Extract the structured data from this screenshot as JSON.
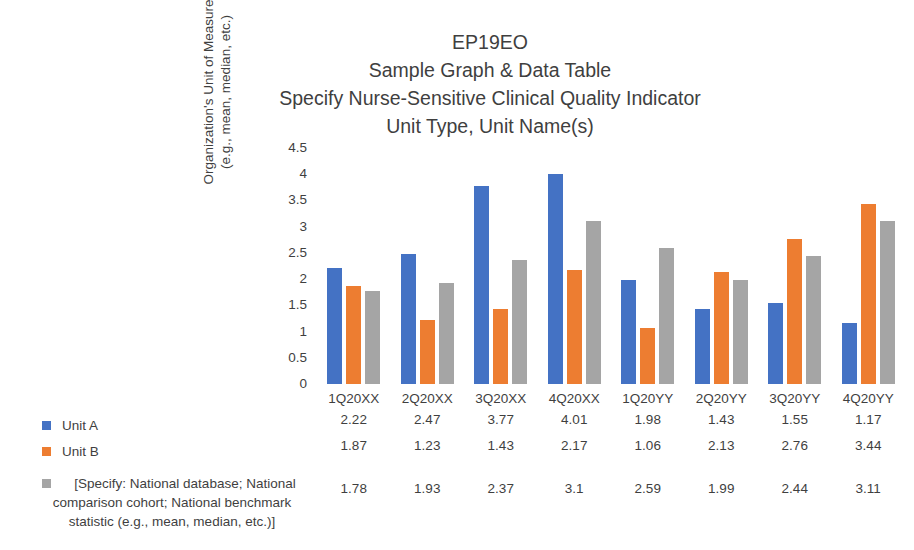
{
  "chart_data": {
    "type": "bar",
    "title": "EP19EO\nSample Graph & Data Table\nSpecify Nurse-Sensitive Clinical Quality Indicator\nUnit Type, Unit Name(s)",
    "title_lines": [
      "EP19EO",
      "Sample Graph & Data Table",
      "Specify Nurse-Sensitive Clinical Quality Indicator",
      "Unit Type, Unit Name(s)"
    ],
    "xlabel": "",
    "ylabel": "Organization's Unit of Measure (e.g., mean, median, etc.)",
    "ylabel_lines": [
      "Organization's Unit of Measure",
      "(e.g., mean, median, etc.)"
    ],
    "categories": [
      "1Q20XX",
      "2Q20XX",
      "3Q20XX",
      "4Q20XX",
      "1Q20YY",
      "2Q20YY",
      "3Q20YY",
      "4Q20YY"
    ],
    "series": [
      {
        "name": "Unit A",
        "color": "#4472C4",
        "values": [
          2.22,
          2.47,
          3.77,
          4.01,
          1.98,
          1.43,
          1.55,
          1.17
        ],
        "labels": [
          "2.22",
          "2.47",
          "3.77",
          "4.01",
          "1.98",
          "1.43",
          "1.55",
          "1.17"
        ]
      },
      {
        "name": "Unit B",
        "color": "#ED7D31",
        "values": [
          1.87,
          1.23,
          1.43,
          2.17,
          1.06,
          2.13,
          2.76,
          3.44
        ],
        "labels": [
          "1.87",
          "1.23",
          "1.43",
          "2.17",
          "1.06",
          "2.13",
          "2.76",
          "3.44"
        ]
      },
      {
        "name": "[Specify: National database; National comparison cohort; National benchmark statistic (e.g., mean, median, etc.)]",
        "name_lines": [
          "[Specify: National database; National",
          "comparison cohort; National benchmark",
          "statistic (e.g., mean, median, etc.)]"
        ],
        "color": "#A5A5A5",
        "values": [
          1.78,
          1.93,
          2.37,
          3.1,
          2.59,
          1.99,
          2.44,
          3.11
        ],
        "labels": [
          "1.78",
          "1.93",
          "2.37",
          "3.1",
          "2.59",
          "1.99",
          "2.44",
          "3.11"
        ]
      }
    ],
    "ylim": [
      0,
      4.5
    ],
    "yticks": [
      0,
      0.5,
      1,
      1.5,
      2,
      2.5,
      3,
      3.5,
      4,
      4.5
    ],
    "ytick_labels": [
      "0",
      "0.5",
      "1",
      "1.5",
      "2",
      "2.5",
      "3",
      "3.5",
      "4",
      "4.5"
    ],
    "grid": false,
    "legend_position": "left-bottom"
  }
}
